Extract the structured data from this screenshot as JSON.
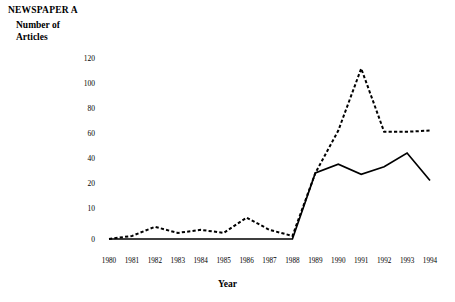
{
  "chart_data": {
    "type": "line",
    "title": "NEWSPAPER A",
    "ylabel_line1": "Number of",
    "ylabel_line2": "Articles",
    "xlabel": "Year",
    "grid": false,
    "legend": "none",
    "x": [
      1980,
      1981,
      1982,
      1983,
      1984,
      1985,
      1986,
      1987,
      1988,
      1989,
      1990,
      1991,
      1992,
      1993,
      1994
    ],
    "categories": [
      "1980",
      "1981",
      "1982",
      "1983",
      "1984",
      "1985",
      "1986",
      "1987",
      "1988",
      "1989",
      "1990",
      "1991",
      "1992",
      "1993",
      "1994"
    ],
    "ytick_labels": [
      "0",
      "10",
      "20",
      "40",
      "60",
      "80",
      "100",
      "120"
    ],
    "ytick_values": [
      0,
      10,
      20,
      40,
      60,
      80,
      100,
      120
    ],
    "ylim": [
      0,
      120
    ],
    "axis_note": "broken nonlinear y-axis: equal pixel spacing between listed ticks",
    "series": [
      {
        "name": "solid-series",
        "style": "solid",
        "color": "#000000",
        "values": [
          0,
          0,
          0,
          0,
          0,
          0,
          0,
          0,
          0,
          28,
          35,
          27,
          33,
          44,
          22
        ]
      },
      {
        "name": "dashed-series",
        "style": "dashed",
        "color": "#000000",
        "values": [
          0,
          1,
          4,
          2,
          3,
          2,
          7,
          3,
          1,
          28,
          62,
          112,
          61,
          61,
          62
        ]
      }
    ]
  }
}
